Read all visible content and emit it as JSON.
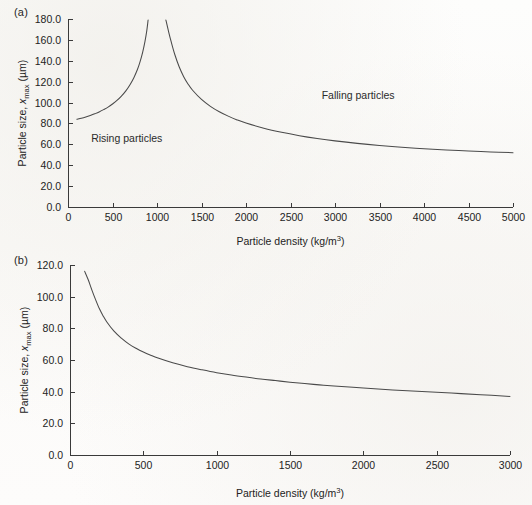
{
  "figure": {
    "panel_a_label": "(a)",
    "panel_b_label": "(b)"
  },
  "chart_data": [
    {
      "id": "chart-a",
      "type": "line",
      "title": "",
      "panel": "(a)",
      "xlabel_plain": "Particle density (kg/m3)",
      "xlabel_parts": {
        "text": "Particle density (kg/m",
        "sup": "3",
        "tail": ")"
      },
      "ylabel_plain": "Particle size, xmax (um)",
      "ylabel_parts": {
        "pre": "Particle size, ",
        "ital": "x",
        "sub": "max",
        "post": " (µm)"
      },
      "xlim": [
        0,
        5000
      ],
      "ylim": [
        0,
        180
      ],
      "xticks": [
        0,
        500,
        1000,
        1500,
        2000,
        2500,
        3000,
        3500,
        4000,
        4500,
        5000
      ],
      "xticklabels": [
        "0",
        "500",
        "1000",
        "1500",
        "2000",
        "2500",
        "3000",
        "3500",
        "4000",
        "4500",
        "5000"
      ],
      "yticks": [
        0,
        20,
        40,
        60,
        80,
        100,
        120,
        140,
        160,
        180
      ],
      "yticklabels": [
        "0.0",
        "20.0",
        "40.0",
        "60.0",
        "80.0",
        "100.0",
        "120.0",
        "140.0",
        "160.0",
        "180.0"
      ],
      "grid": false,
      "legend": false,
      "asymptote_x": 1000,
      "annotations": [
        {
          "text": "Rising particles",
          "x": 260,
          "y": 62
        },
        {
          "text": "Falling particles",
          "x": 2850,
          "y": 103
        }
      ],
      "series": [
        {
          "name": "Rising particles branch",
          "x": [
            100,
            150,
            200,
            250,
            300,
            350,
            400,
            450,
            500,
            550,
            600,
            650,
            700,
            740,
            780,
            810,
            840,
            865,
            885,
            900
          ],
          "values": [
            84.0,
            85.0,
            86.2,
            87.6,
            89.2,
            91.0,
            93.2,
            95.6,
            98.6,
            102.0,
            106.2,
            111.2,
            117.6,
            123.8,
            131.6,
            139.2,
            148.6,
            158.6,
            168.6,
            179.0
          ]
        },
        {
          "name": "Falling particles branch",
          "x": [
            1100,
            1130,
            1160,
            1200,
            1250,
            1300,
            1350,
            1400,
            1500,
            1600,
            1700,
            1800,
            1900,
            2000,
            2200,
            2400,
            2600,
            2800,
            3000,
            3250,
            3500,
            3750,
            4000,
            4250,
            4500,
            4750,
            5000
          ],
          "values": [
            179.0,
            168.0,
            158.0,
            146.0,
            134.0,
            124.8,
            117.6,
            111.8,
            103.0,
            96.4,
            91.2,
            87.0,
            83.4,
            80.4,
            75.4,
            71.5,
            68.3,
            65.6,
            63.3,
            60.9,
            58.9,
            57.2,
            55.8,
            54.6,
            53.6,
            52.7,
            52.0
          ]
        }
      ]
    },
    {
      "id": "chart-b",
      "type": "line",
      "title": "",
      "panel": "(b)",
      "xlabel_plain": "Particle density (kg/m3)",
      "xlabel_parts": {
        "text": "Particle density (kg/m",
        "sup": "3",
        "tail": ")"
      },
      "ylabel_plain": "Particle size, xmax (um)",
      "ylabel_parts": {
        "pre": "Particle size, ",
        "ital": "x",
        "sub": "max",
        "post": " (µm)"
      },
      "xlim": [
        0,
        3000
      ],
      "ylim": [
        0,
        120
      ],
      "xticks": [
        0,
        500,
        1000,
        1500,
        2000,
        2500,
        3000
      ],
      "xticklabels": [
        "0",
        "500",
        "1000",
        "1500",
        "2000",
        "2500",
        "3000"
      ],
      "yticks": [
        0,
        20,
        40,
        60,
        80,
        100,
        120
      ],
      "yticklabels": [
        "0.0",
        "20.0",
        "40.0",
        "60.0",
        "80.0",
        "100.0",
        "120.0"
      ],
      "grid": false,
      "legend": false,
      "annotations": [],
      "series": [
        {
          "name": "Maximum particle size",
          "x": [
            100,
            125,
            150,
            175,
            200,
            225,
            250,
            300,
            350,
            400,
            450,
            500,
            550,
            600,
            700,
            800,
            900,
            1000,
            1100,
            1200,
            1300,
            1400,
            1500,
            1600,
            1700,
            1800,
            2000,
            2200,
            2400,
            2600,
            2800,
            3000
          ],
          "values": [
            116.0,
            110.5,
            104.0,
            98.0,
            92.5,
            88.0,
            84.2,
            78.2,
            73.8,
            70.2,
            67.4,
            65.0,
            63.0,
            61.2,
            58.2,
            55.8,
            53.8,
            52.0,
            50.5,
            49.2,
            48.0,
            47.0,
            46.0,
            45.1,
            44.3,
            43.6,
            42.3,
            41.1,
            40.1,
            39.1,
            38.1,
            37.0
          ]
        }
      ]
    }
  ]
}
